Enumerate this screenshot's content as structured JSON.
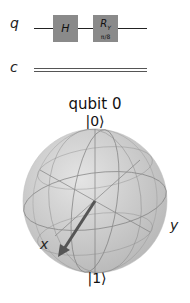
{
  "circuit": {
    "quantum_register": "q",
    "classical_register": "c",
    "gates": [
      {
        "name": "H",
        "label": "H"
      },
      {
        "name": "Ry",
        "label": "R",
        "subscript": "Y",
        "param": "π/8"
      }
    ],
    "colors": {
      "gate_fill": "#8a8a8a",
      "wire": "#222222",
      "classical_wire": "#555555"
    }
  },
  "bloch": {
    "title": "qubit 0",
    "north_label": "|0⟩",
    "south_label": "|1⟩",
    "x_label": "x",
    "y_label": "y",
    "colors": {
      "sphere": "#d0d0d0",
      "grid": "#707070",
      "vector": "#555555"
    }
  }
}
